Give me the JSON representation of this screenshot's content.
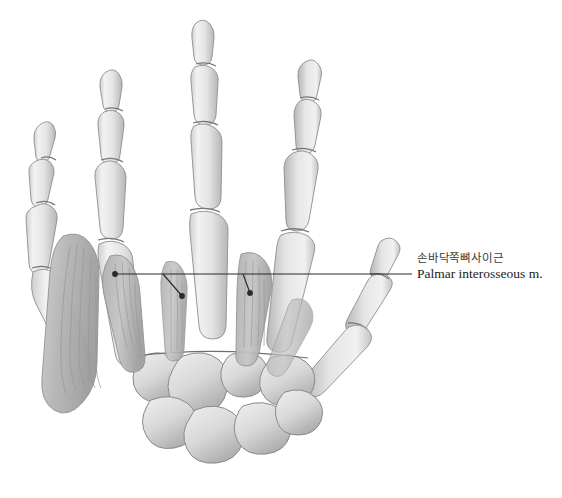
{
  "figure": {
    "view": "palmar (anterior) view of hand skeleton with interosseous muscles",
    "background_color": "#ffffff",
    "bone_fill": "#e9e9e9",
    "bone_shade": "#b9b9b9",
    "bone_outline": "#8a8a8a",
    "muscle_fill": "#c9c9c9",
    "muscle_fiber": "#9a9a9a",
    "leader_color": "#2b2b2b"
  },
  "annotation": {
    "label_korean": "손바닥쪽뼈사이근",
    "label_latin": "Palmar interosseous m.",
    "korean_color": "#3b3b3b",
    "latin_color": "#1c1c1c",
    "leader": {
      "stem_start_x": 412,
      "stem_end_x": 115,
      "stem_y": 274,
      "branches": [
        {
          "name": "branch-fifth-interosseous",
          "from_x": 115,
          "from_y": 274,
          "to_x": 115,
          "to_y": 274,
          "dot": true
        },
        {
          "name": "branch-fourth-interosseous",
          "from_x": 163,
          "from_y": 274,
          "to_x": 182,
          "to_y": 296,
          "dot": true
        },
        {
          "name": "branch-second-interosseous",
          "from_x": 243,
          "from_y": 274,
          "to_x": 250,
          "to_y": 293,
          "dot": true
        }
      ]
    }
  },
  "anatomy": {
    "digits": [
      {
        "name": "little-finger",
        "ordinal": 5
      },
      {
        "name": "ring-finger",
        "ordinal": 4
      },
      {
        "name": "middle-finger",
        "ordinal": 3
      },
      {
        "name": "index-finger",
        "ordinal": 2
      },
      {
        "name": "thumb",
        "ordinal": 1
      }
    ],
    "bone_groups": [
      "distal phalanges",
      "middle phalanges",
      "proximal phalanges",
      "metacarpals",
      "carpal bones"
    ],
    "muscles": [
      "palmar interosseous (2nd)",
      "palmar interosseous (4th)",
      "palmar interosseous (5th)",
      "hypothenar muscle mass"
    ]
  }
}
